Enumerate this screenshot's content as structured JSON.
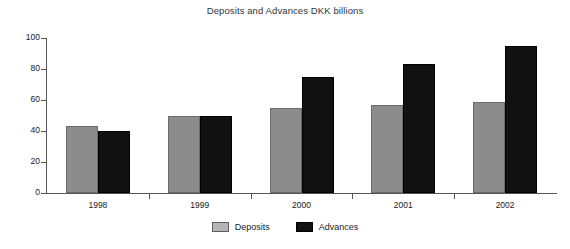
{
  "chart_data": {
    "type": "bar",
    "title": "Deposits and Advances DKK billions",
    "xlabel": "",
    "ylabel": "",
    "ylim": [
      0,
      100
    ],
    "yticks": [
      0,
      20,
      40,
      60,
      80,
      100
    ],
    "ytick_labels": [
      "0",
      "20",
      "40",
      "60",
      "80",
      "100"
    ],
    "grid": false,
    "legend_position": "bottom-center",
    "categories": [
      "1998",
      "1999",
      "2000",
      "2001",
      "2002"
    ],
    "series": [
      {
        "name": "Deposits",
        "color": "#8c8c8c",
        "values": [
          43,
          50,
          55,
          56.5,
          59
        ]
      },
      {
        "name": "Advances",
        "color": "#111111",
        "values": [
          40,
          50,
          75,
          83,
          95
        ]
      }
    ]
  },
  "legend": {
    "items": [
      {
        "label": "Deposits",
        "swatch": "deposits-swatch"
      },
      {
        "label": "Advances",
        "swatch": "advances-swatch"
      }
    ]
  }
}
